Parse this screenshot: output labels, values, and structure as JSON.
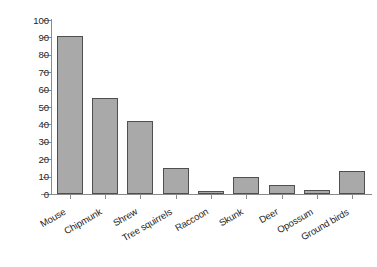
{
  "chart_data": {
    "type": "bar",
    "title": "",
    "subtitle": "",
    "xlabel": "",
    "ylabel": "Percent of larvae infected",
    "ylim": [
      0,
      100
    ],
    "ytick_step": 10,
    "yticks": [
      0,
      10,
      20,
      30,
      40,
      50,
      60,
      70,
      80,
      90,
      100
    ],
    "grid": false,
    "legend": false,
    "legend_position": "none",
    "xtick_label_rotation_deg": 30,
    "categories": [
      "Mouse",
      "Chipmunk",
      "Shrew",
      "Tree squirrels",
      "Raccoon",
      "Skunk",
      "Deer",
      "Opossum",
      "Ground birds"
    ],
    "values": [
      91,
      55,
      42,
      15,
      1.5,
      10,
      5,
      2.5,
      13
    ],
    "annotations": [],
    "colors": {
      "bar_fill": "#a9a9a9",
      "bar_border": "#4f4f4f",
      "axis": "#8a8a8a",
      "text": "#1c1c1c",
      "background": "#ffffff"
    }
  }
}
